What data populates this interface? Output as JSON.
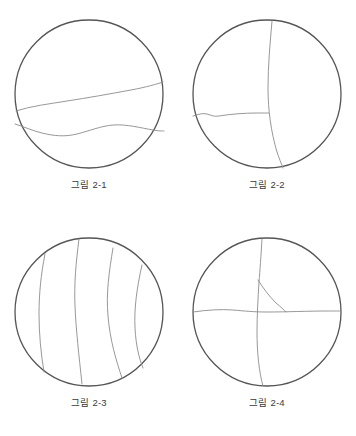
{
  "sheet": {
    "background_color": "#ffffff",
    "outline_color": "#555555",
    "crack_color": "#8c8c8c",
    "caption_color": "#3a3a3a"
  },
  "figures": [
    {
      "id": "figure-2-1",
      "caption": "그림 2-1",
      "description": "원형 단면 내 두 개의 수평 균열선",
      "circle": {
        "cx": 80,
        "cy": 80,
        "r": 74
      },
      "cracks": [
        {
          "name": "upper-horizontal-crack",
          "orientation": "horizontal",
          "path": "M 7 97 C 22 92 40 90 58 87 C 78 84 100 80 122 76 C 138 73 148 70 154 68"
        },
        {
          "name": "lower-horizontal-crack",
          "orientation": "horizontal",
          "path": "M 6 110 C 16 113 24 117 33 119 C 45 122 56 123 68 120 C 80 117 92 112 104 111 C 118 110 132 114 144 116 C 150 117 153 117 155 117"
        }
      ]
    },
    {
      "id": "figure-2-2",
      "caption": "그림 2-2",
      "description": "원형 단면 내 수직 균열과 좌측 수평 균열",
      "circle": {
        "cx": 80,
        "cy": 80,
        "r": 74
      },
      "cracks": [
        {
          "name": "vertical-crack",
          "orientation": "vertical",
          "path": "M 85 7 C 83 30 81 52 81 74 C 81 96 84 118 90 138 C 93 147 95 151 96 154"
        },
        {
          "name": "left-horizontal-crack",
          "orientation": "horizontal",
          "path": "M 6 102 C 12 100 16 99 20 100 C 24 101 27 103 32 102 C 44 100 58 99 70 99 C 76 99 80 99 82 99"
        }
      ]
    },
    {
      "id": "figure-2-3",
      "caption": "그림 2-3",
      "description": "원형 단면 내 네 개의 수직 균열선",
      "circle": {
        "cx": 80,
        "cy": 80,
        "r": 74
      },
      "cracks": [
        {
          "name": "vertical-crack-1",
          "orientation": "vertical",
          "path": "M 36 22 C 32 42 30 62 30 82 C 30 102 32 122 35 140"
        },
        {
          "name": "vertical-crack-2",
          "orientation": "vertical",
          "path": "M 70 7 C 67 30 65 52 66 74 C 67 98 70 124 73 152"
        },
        {
          "name": "vertical-crack-3",
          "orientation": "vertical",
          "path": "M 104 16 C 100 40 97 62 99 84 C 101 108 107 128 113 146"
        },
        {
          "name": "vertical-crack-4",
          "orientation": "vertical",
          "path": "M 133 33 C 128 55 125 76 126 96 C 127 114 130 126 134 136"
        }
      ]
    },
    {
      "id": "figure-2-4",
      "caption": "그림 2-4",
      "description": "원형 단면 내 수직·수평 균열과 삼각 분기 균열",
      "circle": {
        "cx": 80,
        "cy": 80,
        "r": 74
      },
      "cracks": [
        {
          "name": "vertical-crack",
          "orientation": "vertical",
          "path": "M 75 7 C 74 24 73 38 72 50 C 71 66 70 84 70 100 C 70 120 72 140 76 154"
        },
        {
          "name": "horizontal-crack",
          "orientation": "horizontal",
          "path": "M 6 80 C 20 78 34 77 46 78 C 58 79 66 80 80 80 C 100 80 122 79 140 79 C 148 79 152 79 154 79"
        },
        {
          "name": "diagonal-branch-crack",
          "orientation": "diagonal",
          "path": "M 71 48 C 76 56 82 64 89 71 C 94 75 97 78 99 80"
        }
      ]
    }
  ]
}
